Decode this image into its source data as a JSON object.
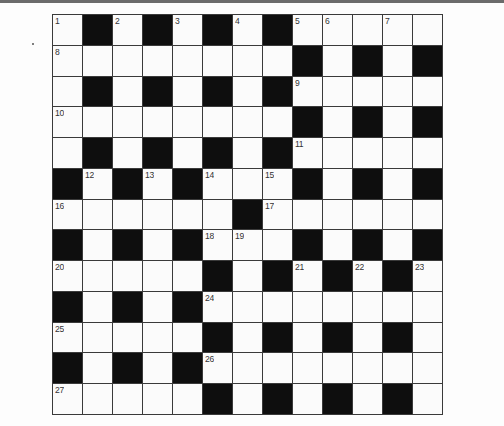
{
  "puzzle": {
    "type": "crossword",
    "rows": 13,
    "cols": 13,
    "colors": {
      "black_cell": "#0e0e0e",
      "white_cell": "#fbfbfb",
      "grid_line": "#3a3a3a",
      "number_text": "#333333",
      "top_rule": "#6b6b6b"
    },
    "layout": [
      "W.W.W.W.WWWWW",
      "WWWWWWWW.W.W.",
      "W.W.W.W.WWWWW",
      "WWWWWWWW.W.W.",
      "W.W.W.W.WWWWW",
      ".W.W.WWW.W.W.",
      "WWWWWW.WWWWWW",
      ".W.W.WWW.W.W.",
      "WWWWW.W.W.W.W",
      ".W.W.WWWWWWWW",
      "WWWWW.W.W.W.W",
      ".W.W.WWWWWWWW",
      "WWWWW.W.W.W.W"
    ],
    "numbers": [
      {
        "row": 0,
        "col": 0,
        "n": "1"
      },
      {
        "row": 0,
        "col": 2,
        "n": "2"
      },
      {
        "row": 0,
        "col": 4,
        "n": "3"
      },
      {
        "row": 0,
        "col": 6,
        "n": "4"
      },
      {
        "row": 0,
        "col": 8,
        "n": "5"
      },
      {
        "row": 0,
        "col": 9,
        "n": "6"
      },
      {
        "row": 0,
        "col": 11,
        "n": "7"
      },
      {
        "row": 1,
        "col": 0,
        "n": "8"
      },
      {
        "row": 2,
        "col": 8,
        "n": "9"
      },
      {
        "row": 3,
        "col": 0,
        "n": "10"
      },
      {
        "row": 4,
        "col": 8,
        "n": "11"
      },
      {
        "row": 5,
        "col": 1,
        "n": "12"
      },
      {
        "row": 5,
        "col": 3,
        "n": "13"
      },
      {
        "row": 5,
        "col": 5,
        "n": "14"
      },
      {
        "row": 5,
        "col": 7,
        "n": "15"
      },
      {
        "row": 6,
        "col": 0,
        "n": "16"
      },
      {
        "row": 6,
        "col": 7,
        "n": "17"
      },
      {
        "row": 7,
        "col": 5,
        "n": "18"
      },
      {
        "row": 7,
        "col": 6,
        "n": "19"
      },
      {
        "row": 8,
        "col": 0,
        "n": "20"
      },
      {
        "row": 8,
        "col": 8,
        "n": "21"
      },
      {
        "row": 8,
        "col": 10,
        "n": "22"
      },
      {
        "row": 8,
        "col": 12,
        "n": "23"
      },
      {
        "row": 9,
        "col": 5,
        "n": "24"
      },
      {
        "row": 10,
        "col": 0,
        "n": "25"
      },
      {
        "row": 11,
        "col": 5,
        "n": "26"
      },
      {
        "row": 12,
        "col": 0,
        "n": "27"
      }
    ]
  }
}
